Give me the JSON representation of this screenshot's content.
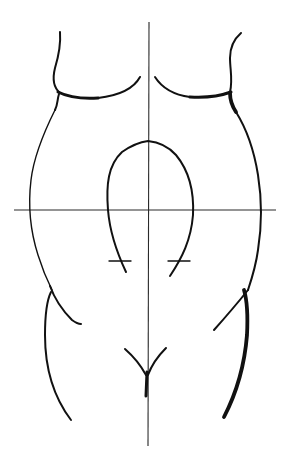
{
  "figure": {
    "description": "Line drawing of a front torso outline with vertical and horizontal reference axes, an inverted-U arch centered on the axes, two short tick marks on the arch legs, and a Y-shaped mark at the lower center.",
    "colors": {
      "background": "#ffffff",
      "ink": "#111111",
      "guide": "#2a2a2a"
    },
    "elements": {
      "vertical_axis": "vertical reference line",
      "horizontal_axis": "horizontal reference line",
      "left_shoulder": "left upper torso contour",
      "right_shoulder": "right upper torso contour",
      "left_side": "left side contour",
      "right_side": "right side contour",
      "arch": "central inverted-U arch",
      "left_tick": "left horizontal tick mark",
      "right_tick": "right horizontal tick mark",
      "left_hip": "left hip contour",
      "right_hip": "right hip contour",
      "center_y_mark": "central Y-shaped mark"
    }
  }
}
